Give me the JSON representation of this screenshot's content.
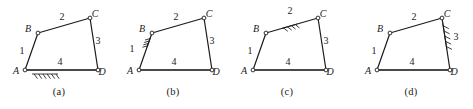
{
  "figure": {
    "stroke_color": "#1a1a1a",
    "ground_color": "#4a4a4a",
    "background": "#ffffff"
  },
  "panels": [
    {
      "caption": "(a)",
      "fixed_link": "4",
      "fixed_link_name": "link-4-AD",
      "ground_hatch_position": "below-AD",
      "vertices": [
        {
          "id": "A",
          "label": "A",
          "x": 25,
          "y": 70,
          "label_dx": -9,
          "label_dy": 4
        },
        {
          "id": "B",
          "label": "B",
          "x": 38,
          "y": 33,
          "label_dx": -10,
          "label_dy": -1
        },
        {
          "id": "C",
          "label": "C",
          "x": 90,
          "y": 18,
          "label_dx": 5,
          "label_dy": -1
        },
        {
          "id": "D",
          "label": "D",
          "x": 98,
          "y": 70,
          "label_dx": 4,
          "label_dy": 5
        }
      ],
      "links": [
        {
          "id": "1",
          "label": "1",
          "from": "A",
          "to": "B",
          "label_x": 22,
          "label_y": 54
        },
        {
          "id": "2",
          "label": "2",
          "from": "B",
          "to": "C",
          "label_x": 62,
          "label_y": 20
        },
        {
          "id": "3",
          "label": "3",
          "from": "C",
          "to": "D",
          "label_x": 98,
          "label_y": 44
        },
        {
          "id": "4",
          "label": "4",
          "from": "A",
          "to": "D",
          "label_x": 60,
          "label_y": 65
        }
      ]
    },
    {
      "caption": "(b)",
      "fixed_link": "1",
      "fixed_link_name": "link-1-AB",
      "ground_hatch_position": "left-of-AB",
      "vertices": [
        {
          "id": "A",
          "label": "A",
          "x": 25,
          "y": 70,
          "label_dx": -9,
          "label_dy": 4
        },
        {
          "id": "B",
          "label": "B",
          "x": 38,
          "y": 33,
          "label_dx": -10,
          "label_dy": -1
        },
        {
          "id": "C",
          "label": "C",
          "x": 90,
          "y": 18,
          "label_dx": 5,
          "label_dy": -1
        },
        {
          "id": "D",
          "label": "D",
          "x": 98,
          "y": 70,
          "label_dx": 4,
          "label_dy": 5
        }
      ],
      "links": [
        {
          "id": "1",
          "label": "1",
          "from": "A",
          "to": "B",
          "label_x": 18,
          "label_y": 52
        },
        {
          "id": "2",
          "label": "2",
          "from": "B",
          "to": "C",
          "label_x": 62,
          "label_y": 20
        },
        {
          "id": "3",
          "label": "3",
          "from": "C",
          "to": "D",
          "label_x": 98,
          "label_y": 44
        },
        {
          "id": "4",
          "label": "4",
          "from": "A",
          "to": "D",
          "label_x": 60,
          "label_y": 65
        }
      ]
    },
    {
      "caption": "(c)",
      "fixed_link": "2",
      "fixed_link_name": "link-2-BC",
      "ground_hatch_position": "above-BC",
      "vertices": [
        {
          "id": "A",
          "label": "A",
          "x": 25,
          "y": 70,
          "label_dx": -9,
          "label_dy": 4
        },
        {
          "id": "B",
          "label": "B",
          "x": 38,
          "y": 33,
          "label_dx": -10,
          "label_dy": -1
        },
        {
          "id": "C",
          "label": "C",
          "x": 90,
          "y": 18,
          "label_dx": 5,
          "label_dy": -1
        },
        {
          "id": "D",
          "label": "D",
          "x": 98,
          "y": 70,
          "label_dx": 4,
          "label_dy": 5
        }
      ],
      "links": [
        {
          "id": "1",
          "label": "1",
          "from": "A",
          "to": "B",
          "label_x": 22,
          "label_y": 54
        },
        {
          "id": "2",
          "label": "2",
          "from": "B",
          "to": "C",
          "label_x": 62,
          "label_y": 14
        },
        {
          "id": "3",
          "label": "3",
          "from": "C",
          "to": "D",
          "label_x": 98,
          "label_y": 44
        },
        {
          "id": "4",
          "label": "4",
          "from": "A",
          "to": "D",
          "label_x": 60,
          "label_y": 65
        }
      ]
    },
    {
      "caption": "(d)",
      "fixed_link": "3",
      "fixed_link_name": "link-3-CD",
      "ground_hatch_position": "right-of-CD",
      "vertices": [
        {
          "id": "A",
          "label": "A",
          "x": 25,
          "y": 70,
          "label_dx": -9,
          "label_dy": 4
        },
        {
          "id": "B",
          "label": "B",
          "x": 38,
          "y": 33,
          "label_dx": -10,
          "label_dy": -1
        },
        {
          "id": "C",
          "label": "C",
          "x": 90,
          "y": 18,
          "label_dx": 5,
          "label_dy": -1
        },
        {
          "id": "D",
          "label": "D",
          "x": 98,
          "y": 70,
          "label_dx": 4,
          "label_dy": 5
        }
      ],
      "links": [
        {
          "id": "1",
          "label": "1",
          "from": "A",
          "to": "B",
          "label_x": 22,
          "label_y": 54
        },
        {
          "id": "2",
          "label": "2",
          "from": "B",
          "to": "C",
          "label_x": 62,
          "label_y": 20
        },
        {
          "id": "3",
          "label": "3",
          "from": "C",
          "to": "D",
          "label_x": 104,
          "label_y": 40
        },
        {
          "id": "4",
          "label": "4",
          "from": "A",
          "to": "D",
          "label_x": 60,
          "label_y": 65
        }
      ]
    }
  ]
}
